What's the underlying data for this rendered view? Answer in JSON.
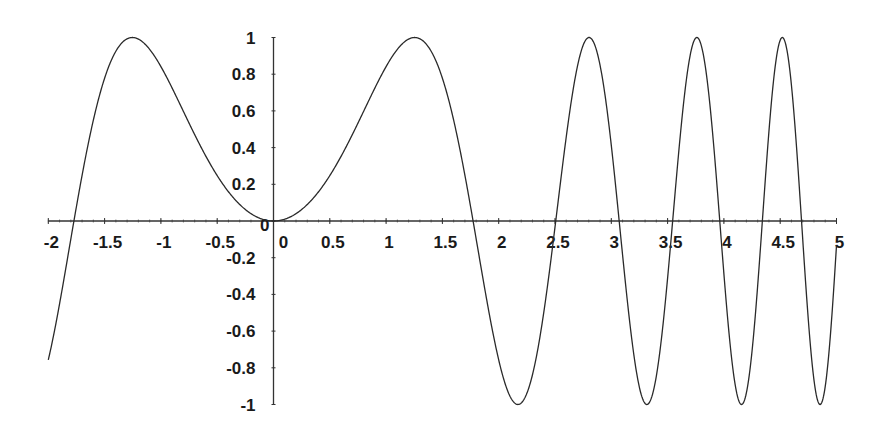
{
  "chart_data": {
    "type": "line",
    "title": "",
    "xlabel": "",
    "ylabel": "",
    "function": "sin(x^2)",
    "xlim": [
      -2,
      5
    ],
    "ylim": [
      -1,
      1
    ],
    "grid": false,
    "legend": null,
    "x_ticks": [
      "-2",
      "-1.5",
      "-1",
      "-0.5",
      "0",
      "0.5",
      "1",
      "1.5",
      "2",
      "2.5",
      "3",
      "3.5",
      "4",
      "4.5",
      "5"
    ],
    "x_tick_values": [
      -2,
      -1.5,
      -1,
      -0.5,
      0,
      0.5,
      1,
      1.5,
      2,
      2.5,
      3,
      3.5,
      4,
      4.5,
      5
    ],
    "y_ticks": [
      "1",
      "0.8",
      "0.6",
      "0.4",
      "0.2",
      "0",
      "-0.2",
      "-0.4",
      "-0.6",
      "-0.8",
      "-1"
    ],
    "y_tick_values": [
      1,
      0.8,
      0.6,
      0.4,
      0.2,
      0,
      -0.2,
      -0.4,
      -0.6,
      -0.8,
      -1
    ],
    "series": [
      {
        "name": "sin(x^2)",
        "x": [
          -2,
          -1.9,
          -1.8,
          -1.7,
          -1.6,
          -1.5,
          -1.4,
          -1.3,
          -1.2533,
          -1.2,
          -1.1,
          -1,
          -0.9,
          -0.8,
          -0.7,
          -0.6,
          -0.5,
          -0.4,
          -0.3,
          -0.2,
          -0.1,
          0,
          0.5,
          1,
          1.2533,
          1.5,
          1.7725,
          2,
          2.1708,
          2.5,
          2.5066,
          2.8025,
          3,
          3.07,
          3.316,
          3.5,
          3.5449,
          3.7599,
          3.9633,
          4,
          4.1568,
          4.3416,
          4.5,
          4.5189,
          4.6894,
          4.8541,
          5
        ],
        "y": [
          -0.757,
          -0.45,
          -0.1,
          0.257,
          0.549,
          0.778,
          0.925,
          0.993,
          1.0,
          0.991,
          0.935,
          0.841,
          0.726,
          0.605,
          0.475,
          0.353,
          0.247,
          0.159,
          0.09,
          0.04,
          0.01,
          0,
          0.247,
          0.841,
          1.0,
          0.778,
          0,
          -0.757,
          -1.0,
          -0.033,
          0,
          1.0,
          0.412,
          0,
          -1.0,
          -0.315,
          0,
          1.0,
          0,
          -0.288,
          -1.0,
          0,
          0.973,
          1.0,
          0,
          -1.0,
          -0.132
        ]
      }
    ]
  },
  "style": {
    "line_color": "#2a2a2a",
    "axis_color": "#333333",
    "text_color": "#1a1a1a",
    "background": "#ffffff"
  }
}
